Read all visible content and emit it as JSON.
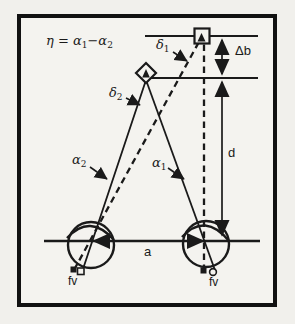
{
  "figure": {
    "formula": {
      "p1": "η = α",
      "s1": "1",
      "p2": "−α",
      "s2": "2"
    },
    "labels": {
      "delta1": {
        "base": "δ",
        "sub": "1"
      },
      "delta2": {
        "base": "δ",
        "sub": "2"
      },
      "alpha1": {
        "base": "α",
        "sub": "1"
      },
      "alpha2": {
        "base": "α",
        "sub": "2"
      },
      "delta_b": "Δb",
      "d": "d",
      "a": "a",
      "fv_left": "fv",
      "fv_right": "fv"
    },
    "icons": {
      "far_target_marker": "open-square",
      "near_target_marker": "open-diamond",
      "left_fovea_solid_end": "open-square",
      "left_fovea_dashed_end": "filled-square",
      "right_fovea_solid_end": "open-circle",
      "right_fovea_dashed_end": "filled-square"
    },
    "colors": {
      "ink": "#1a1a1a",
      "background": "#f1f0ec",
      "paper": "#f4f3ef"
    }
  }
}
